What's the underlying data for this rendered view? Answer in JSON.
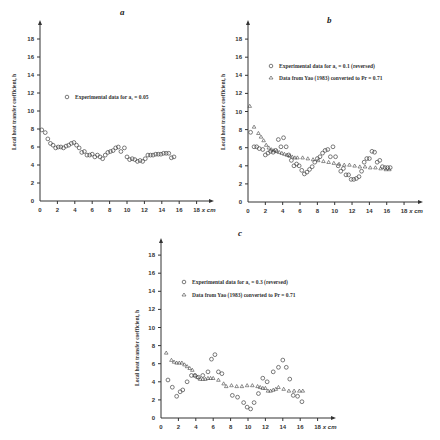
{
  "chart_data": [
    {
      "id": "a",
      "type": "scatter",
      "title": "a",
      "xlabel": "x cm",
      "ylabel": "Local heat transfer coefficient, h",
      "xlim": [
        0,
        19
      ],
      "ylim": [
        0,
        19
      ],
      "xticks": [
        0,
        2,
        4,
        6,
        8,
        10,
        12,
        14,
        16,
        18
      ],
      "yticks": [
        0,
        2,
        4,
        6,
        8,
        10,
        12,
        14,
        16,
        18
      ],
      "legend": [
        {
          "marker": "circle",
          "label": "Experimental data for a₁ = 0.05"
        }
      ],
      "series": [
        {
          "name": "Experimental data for a₁ = 0.05",
          "marker": "circle",
          "x": [
            0.2,
            0.6,
            0.9,
            1.2,
            1.5,
            1.8,
            2.1,
            2.4,
            2.7,
            3.0,
            3.3,
            3.6,
            3.9,
            4.2,
            4.5,
            4.8,
            5.1,
            5.4,
            5.7,
            6.0,
            6.3,
            6.6,
            6.9,
            7.2,
            7.5,
            7.8,
            8.1,
            8.4,
            8.7,
            9.0,
            9.3,
            9.7,
            10.0,
            10.3,
            10.6,
            10.9,
            11.2,
            11.5,
            11.8,
            12.1,
            12.4,
            12.7,
            13.0,
            13.3,
            13.6,
            13.9,
            14.2,
            14.5,
            14.8,
            15.1,
            15.4
          ],
          "y": [
            7.9,
            7.6,
            6.9,
            6.4,
            6.2,
            5.9,
            6.0,
            6.0,
            5.9,
            6.1,
            6.2,
            6.4,
            6.5,
            6.2,
            5.9,
            5.4,
            5.5,
            5.1,
            5.1,
            5.2,
            4.9,
            5.1,
            4.9,
            4.7,
            5.1,
            5.4,
            5.5,
            5.6,
            5.9,
            6.0,
            5.5,
            5.9,
            4.9,
            4.6,
            4.7,
            4.6,
            4.4,
            4.5,
            4.4,
            4.7,
            5.1,
            5.1,
            5.1,
            5.2,
            5.2,
            5.2,
            5.3,
            5.3,
            5.3,
            4.8,
            4.9
          ]
        }
      ]
    },
    {
      "id": "b",
      "type": "scatter",
      "title": "b",
      "xlabel": "x cm",
      "ylabel": "Local heat transfer coefficient, h",
      "xlim": [
        0,
        19
      ],
      "ylim": [
        0,
        19
      ],
      "xticks": [
        0,
        2,
        4,
        6,
        8,
        10,
        12,
        14,
        16,
        18
      ],
      "yticks": [
        0,
        2,
        4,
        6,
        8,
        10,
        12,
        14,
        16,
        18
      ],
      "legend": [
        {
          "marker": "circle",
          "label": "Experimental data for a₁ = 0.1 (reversed)"
        },
        {
          "marker": "triangle",
          "label": "Data from Yao (1983) converted to Pr = 0.71"
        }
      ],
      "series": [
        {
          "name": "Experimental data for a₁ = 0.1 (reversed)",
          "marker": "circle",
          "x": [
            0.3,
            0.7,
            1.0,
            1.3,
            1.7,
            2.0,
            2.3,
            2.6,
            2.9,
            3.2,
            3.5,
            3.8,
            4.1,
            4.4,
            4.7,
            5.0,
            5.3,
            5.6,
            5.9,
            6.2,
            6.5,
            6.8,
            7.1,
            7.4,
            7.7,
            8.0,
            8.3,
            8.6,
            8.9,
            9.2,
            9.5,
            9.8,
            10.1,
            10.4,
            10.7,
            11.0,
            11.3,
            11.6,
            11.9,
            12.2,
            12.5,
            12.8,
            13.1,
            13.4,
            13.7,
            14.0,
            14.3,
            14.6,
            14.9,
            15.2,
            15.5,
            15.8,
            16.1,
            16.4
          ],
          "y": [
            7.7,
            6.1,
            6.1,
            5.9,
            5.8,
            5.2,
            5.4,
            5.6,
            5.5,
            5.7,
            6.9,
            6.1,
            7.1,
            6.1,
            5.2,
            4.6,
            4.0,
            4.2,
            4.0,
            3.5,
            3.1,
            3.3,
            3.6,
            3.9,
            4.4,
            4.8,
            5.0,
            5.4,
            5.7,
            5.8,
            5.0,
            6.1,
            5.0,
            4.0,
            3.4,
            3.7,
            3.0,
            3.0,
            2.5,
            2.5,
            2.6,
            2.8,
            3.4,
            4.4,
            4.8,
            4.8,
            5.6,
            5.5,
            4.4,
            4.6,
            3.9,
            3.8,
            3.8,
            3.8
          ]
        },
        {
          "name": "Data from Yao (1983) converted to Pr = 0.71",
          "marker": "triangle",
          "x": [
            0.2,
            0.7,
            1.2,
            1.5,
            1.8,
            2.1,
            2.4,
            2.7,
            3.0,
            3.3,
            3.6,
            3.9,
            4.2,
            4.5,
            4.8,
            5.1,
            5.4,
            5.7,
            6.3,
            6.9,
            7.5,
            8.1,
            8.7,
            9.3,
            9.9,
            10.5,
            11.1,
            11.7,
            12.3,
            12.9,
            13.5,
            14.1,
            14.7,
            15.3,
            15.9,
            16.3
          ],
          "y": [
            10.6,
            8.3,
            7.6,
            7.2,
            6.8,
            6.3,
            6.0,
            5.8,
            5.7,
            5.6,
            5.5,
            5.4,
            5.3,
            5.2,
            5.1,
            5.0,
            4.9,
            4.9,
            4.9,
            4.8,
            4.7,
            4.6,
            4.5,
            4.4,
            4.3,
            4.2,
            4.1,
            4.1,
            4.0,
            3.9,
            3.9,
            3.8,
            3.8,
            3.7,
            3.6,
            3.6
          ]
        }
      ]
    },
    {
      "id": "c",
      "type": "scatter",
      "title": "c",
      "xlabel": "x cm",
      "ylabel": "Local heat transfer coefficient, h",
      "xlim": [
        0,
        19
      ],
      "ylim": [
        0,
        19
      ],
      "xticks": [
        0,
        2,
        4,
        6,
        8,
        10,
        12,
        14,
        16,
        18
      ],
      "yticks": [
        0,
        2,
        4,
        6,
        8,
        10,
        12,
        14,
        16,
        18
      ],
      "legend": [
        {
          "marker": "circle",
          "label": "Experimental data for a₁ = 0.3 (reversed)"
        },
        {
          "marker": "triangle",
          "label": "Data from Yao (1983) converted to Pr = 0.71"
        }
      ],
      "series": [
        {
          "name": "Experimental data for a₁ = 0.3 (reversed)",
          "marker": "circle",
          "x": [
            0.8,
            1.3,
            1.8,
            2.2,
            2.5,
            3.0,
            3.5,
            3.9,
            4.3,
            4.8,
            5.4,
            5.8,
            6.2,
            6.6,
            7.0,
            8.2,
            8.8,
            9.5,
            9.9,
            10.3,
            10.7,
            11.2,
            11.7,
            12.2,
            12.9,
            13.5,
            14.0,
            14.4,
            14.8,
            15.2,
            15.7,
            16.2
          ],
          "y": [
            4.2,
            3.4,
            2.4,
            2.9,
            3.1,
            4.0,
            4.7,
            4.7,
            4.5,
            4.7,
            5.1,
            6.5,
            7.0,
            5.1,
            4.9,
            2.5,
            2.3,
            1.7,
            1.2,
            1.0,
            1.7,
            2.7,
            4.4,
            4.0,
            5.1,
            5.6,
            6.4,
            5.6,
            4.3,
            2.5,
            2.4,
            1.8
          ]
        },
        {
          "name": "Data from Yao (1983) converted to Pr = 0.71",
          "marker": "triangle",
          "x": [
            0.6,
            1.2,
            1.5,
            1.8,
            2.1,
            2.4,
            2.7,
            3.0,
            3.3,
            3.6,
            3.9,
            4.2,
            4.5,
            4.8,
            5.1,
            5.4,
            5.7,
            6.0,
            6.6,
            7.2,
            7.5,
            8.1,
            8.7,
            9.3,
            9.9,
            10.5,
            11.1,
            11.4,
            11.7,
            12.0,
            12.3,
            12.6,
            12.9,
            13.2,
            13.5,
            14.1,
            14.7,
            15.3,
            15.9,
            16.3
          ],
          "y": [
            7.2,
            6.4,
            6.2,
            6.1,
            6.1,
            6.1,
            5.9,
            5.7,
            5.5,
            5.3,
            4.7,
            4.5,
            4.3,
            4.3,
            4.3,
            4.4,
            4.4,
            4.4,
            4.2,
            3.8,
            3.5,
            3.6,
            3.5,
            3.5,
            3.6,
            3.6,
            3.5,
            3.4,
            3.3,
            3.3,
            3.0,
            3.0,
            3.1,
            3.2,
            3.4,
            3.2,
            3.0,
            3.0,
            3.0,
            3.0
          ]
        }
      ]
    }
  ]
}
